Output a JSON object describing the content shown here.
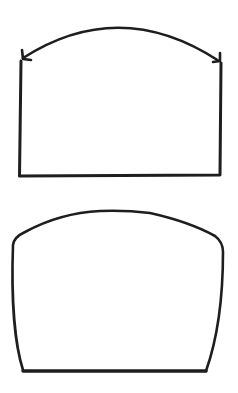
{
  "diagram": {
    "stroke_color": "#1e1e1e",
    "background": "#ffffff",
    "shapes": [
      {
        "name": "rectangle-with-double-arrow-arc",
        "parts": [
          "rectangle-open-top",
          "double-headed-curved-arrow"
        ]
      },
      {
        "name": "rounded-top-trapezoid",
        "parts": [
          "curved-top",
          "tapered-sides",
          "flat-bottom"
        ]
      }
    ]
  }
}
